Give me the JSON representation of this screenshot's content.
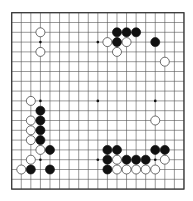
{
  "board": {
    "size": 19,
    "origin_x": 11.7,
    "origin_y": 12.7,
    "step_x": 9.57,
    "step_y": 9.8,
    "line_color": "#555555",
    "border_color": "#333333",
    "star_points": [
      [
        3,
        3
      ],
      [
        3,
        9
      ],
      [
        3,
        15
      ],
      [
        9,
        3
      ],
      [
        9,
        9
      ],
      [
        9,
        15
      ],
      [
        15,
        3
      ],
      [
        15,
        9
      ],
      [
        15,
        15
      ]
    ],
    "stones": [
      {
        "color": "white",
        "col": 3,
        "row": 2
      },
      {
        "color": "white",
        "col": 3,
        "row": 4
      },
      {
        "color": "black",
        "col": 11,
        "row": 2
      },
      {
        "color": "black",
        "col": 12,
        "row": 2
      },
      {
        "color": "black",
        "col": 13,
        "row": 2
      },
      {
        "color": "white",
        "col": 10,
        "row": 3
      },
      {
        "color": "black",
        "col": 11,
        "row": 3
      },
      {
        "color": "white",
        "col": 12,
        "row": 3
      },
      {
        "color": "black",
        "col": 15,
        "row": 3
      },
      {
        "color": "white",
        "col": 11,
        "row": 4
      },
      {
        "color": "white",
        "col": 16,
        "row": 5
      },
      {
        "color": "white",
        "col": 2,
        "row": 9
      },
      {
        "color": "black",
        "col": 3,
        "row": 10
      },
      {
        "color": "white",
        "col": 2,
        "row": 11
      },
      {
        "color": "black",
        "col": 3,
        "row": 11
      },
      {
        "color": "white",
        "col": 2,
        "row": 12
      },
      {
        "color": "black",
        "col": 3,
        "row": 12
      },
      {
        "color": "white",
        "col": 2,
        "row": 13
      },
      {
        "color": "black",
        "col": 3,
        "row": 13
      },
      {
        "color": "white",
        "col": 3,
        "row": 14
      },
      {
        "color": "black",
        "col": 4,
        "row": 14
      },
      {
        "color": "white",
        "col": 2,
        "row": 15
      },
      {
        "color": "white",
        "col": 1,
        "row": 16
      },
      {
        "color": "black",
        "col": 2,
        "row": 16
      },
      {
        "color": "black",
        "col": 4,
        "row": 16
      },
      {
        "color": "white",
        "col": 15,
        "row": 11
      },
      {
        "color": "black",
        "col": 10,
        "row": 14
      },
      {
        "color": "black",
        "col": 11,
        "row": 14
      },
      {
        "color": "black",
        "col": 15,
        "row": 14
      },
      {
        "color": "black",
        "col": 16,
        "row": 14
      },
      {
        "color": "black",
        "col": 10,
        "row": 15
      },
      {
        "color": "white",
        "col": 11,
        "row": 15
      },
      {
        "color": "black",
        "col": 12,
        "row": 15
      },
      {
        "color": "black",
        "col": 13,
        "row": 15
      },
      {
        "color": "black",
        "col": 14,
        "row": 15
      },
      {
        "color": "white",
        "col": 16,
        "row": 15
      },
      {
        "color": "black",
        "col": 10,
        "row": 16
      },
      {
        "color": "white",
        "col": 11,
        "row": 16
      },
      {
        "color": "white",
        "col": 12,
        "row": 16
      },
      {
        "color": "white",
        "col": 13,
        "row": 16
      },
      {
        "color": "white",
        "col": 14,
        "row": 16
      },
      {
        "color": "white",
        "col": 15,
        "row": 16
      }
    ]
  }
}
